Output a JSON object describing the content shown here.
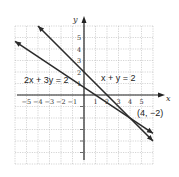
{
  "chart_data": {
    "type": "line",
    "title": "",
    "xlabel": "x",
    "ylabel": "y",
    "xlim": [
      -6,
      6
    ],
    "ylim": [
      -6,
      6
    ],
    "grid": true,
    "x_ticks": [
      "-5",
      "-4",
      "-3",
      "-2",
      "-1",
      "1",
      "2",
      "3",
      "4",
      "5"
    ],
    "y_ticks": [
      "5",
      "4",
      "3",
      "2",
      "1"
    ],
    "series": [
      {
        "name": "x + y = 2",
        "equation": "x + y = 2",
        "points": [
          [
            -4,
            6
          ],
          [
            6,
            -4
          ]
        ],
        "slope": -1,
        "intercept": 2
      },
      {
        "name": "2x + 3y = 2",
        "equation": "2x + 3y = 2",
        "points": [
          [
            -6,
            4.67
          ],
          [
            6,
            -3.33
          ]
        ],
        "slope": -0.667,
        "intercept": 0.667
      }
    ],
    "annotations": [
      {
        "text": "x + y = 2",
        "at": [
          2.2,
          1.5
        ]
      },
      {
        "text": "2x + 3y = 2",
        "at": [
          -5.2,
          1.3
        ]
      },
      {
        "text": "(4, −2)",
        "at": [
          4.5,
          -1.6
        ],
        "marks_point": [
          4,
          -2
        ]
      }
    ]
  },
  "labels": {
    "x_axis": "x",
    "y_axis": "y",
    "eq1": "x + y = 2",
    "eq2": "2x + 3y = 2",
    "intersection": "(4, −2)"
  }
}
